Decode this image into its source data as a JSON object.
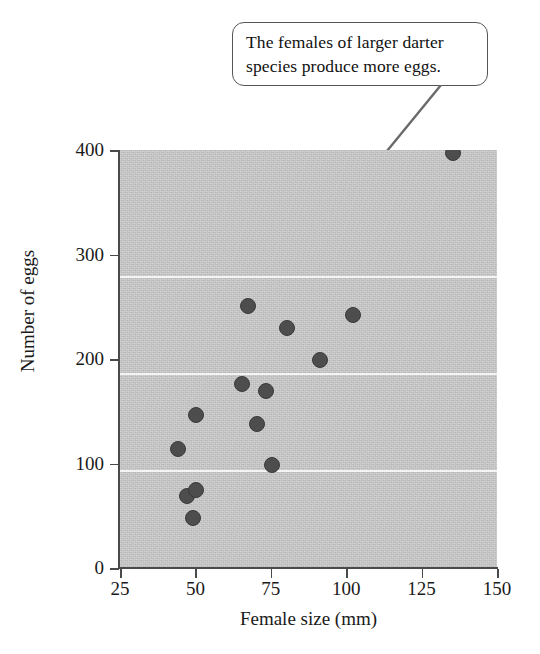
{
  "callout": {
    "text": "The females of larger darter species produce more eggs.",
    "line1": "The females of larger darter",
    "line2": "species produce more eggs."
  },
  "chart_data": {
    "type": "scatter",
    "title": "",
    "xlabel": "Female size (mm)",
    "ylabel": "Number of eggs",
    "xlim": [
      25,
      150
    ],
    "ylim": [
      0,
      400
    ],
    "xticks": [
      25,
      50,
      75,
      100,
      125,
      150
    ],
    "yticks": [
      0,
      100,
      200,
      300,
      400
    ],
    "grid": "horizontal-white-gridlines-at-100-200-300",
    "legend": "none",
    "plot_background": "#c9c9c9",
    "marker_color": "#4d4d4d",
    "annotation": "The females of larger darter species produce more eggs.",
    "annotation_target": "largest-female-size-highest-egg-count-point",
    "points": [
      {
        "x": 44,
        "y": 115
      },
      {
        "x": 47,
        "y": 70
      },
      {
        "x": 49,
        "y": 49
      },
      {
        "x": 50,
        "y": 76
      },
      {
        "x": 50,
        "y": 147
      },
      {
        "x": 65,
        "y": 177
      },
      {
        "x": 67,
        "y": 252
      },
      {
        "x": 70,
        "y": 139
      },
      {
        "x": 73,
        "y": 170
      },
      {
        "x": 75,
        "y": 100
      },
      {
        "x": 80,
        "y": 231
      },
      {
        "x": 91,
        "y": 200
      },
      {
        "x": 102,
        "y": 243
      },
      {
        "x": 135,
        "y": 398
      }
    ]
  }
}
